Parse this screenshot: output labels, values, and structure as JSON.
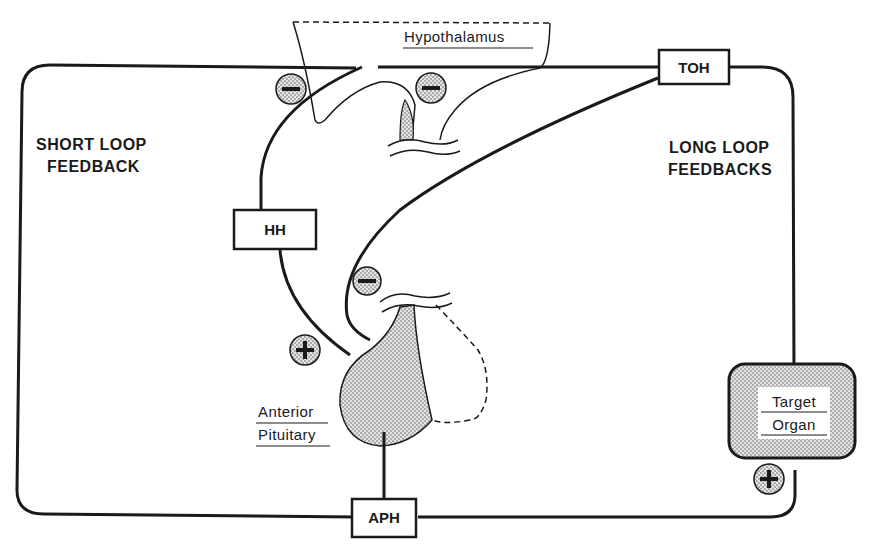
{
  "diagram": {
    "type": "endocrine-feedback-loop",
    "labels": {
      "hypothalamus": "Hypothalamus",
      "short_loop_line1": "SHORT LOOP",
      "short_loop_line2": "FEEDBACK",
      "long_loop_line1": "LONG LOOP",
      "long_loop_line2": "FEEDBACKS",
      "anterior_line1": "Anterior",
      "anterior_line2": "Pituitary",
      "target_line1": "Target",
      "target_line2": "Organ"
    },
    "boxes": {
      "toh": "TOH",
      "hh": "HH",
      "aph": "APH"
    },
    "signs": {
      "minus": "−",
      "plus": "+"
    },
    "colors": {
      "ink": "#1a1a1a",
      "stipple": "#bdbdbd",
      "background": "#ffffff"
    }
  }
}
